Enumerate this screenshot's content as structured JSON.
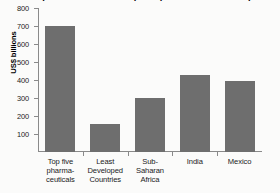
{
  "chart_data": {
    "type": "bar",
    "title": "Comparison of sales of top five pharmaceutical companies and GNP of developing countries",
    "subtitle": "",
    "xlabel": "",
    "ylabel": "US$ billions",
    "ylim": [
      0,
      800
    ],
    "ytick_labels": [
      "100",
      "200",
      "300",
      "400",
      "500",
      "600",
      "700",
      "800"
    ],
    "ytick_values": [
      100,
      200,
      300,
      400,
      500,
      600,
      700,
      800
    ],
    "grid": false,
    "legend": "none",
    "bar_color": "#6e6e6e",
    "background_color": "#fbfbfa",
    "axis_color": "#8a8a8a",
    "categories": [
      "Top five pharmaceuticals",
      "Least Developed Countries",
      "Sub-Saharan Africa",
      "India",
      "Mexico"
    ],
    "category_lines": [
      [
        "Top five",
        "pharma-",
        "ceuticals"
      ],
      [
        "Least",
        "Developed",
        "Countries"
      ],
      [
        "Sub-",
        "Saharan",
        "Africa"
      ],
      [
        "India"
      ],
      [
        "Mexico"
      ]
    ],
    "values": [
      700,
      155,
      300,
      430,
      395
    ]
  }
}
